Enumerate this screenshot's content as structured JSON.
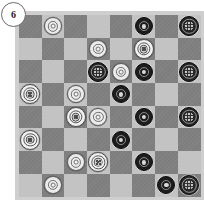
{
  "badge": {
    "label": "6",
    "name": "move-number-badge"
  },
  "board": {
    "rows": 8,
    "cols": 8,
    "colors": {
      "dark_square": "#7e7e7e",
      "light_square": "#c3c3c3",
      "frame": "#cfcfcf",
      "white_piece": "#ebebeb",
      "black_piece": "#1d1d1d",
      "page_background": "#ffffff"
    },
    "squares": [
      [
        {
          "shade": "dark",
          "piece": null
        },
        {
          "shade": "light",
          "piece": {
            "color": "white",
            "rank": "man"
          }
        },
        {
          "shade": "dark",
          "piece": null
        },
        {
          "shade": "light",
          "piece": null
        },
        {
          "shade": "dark",
          "piece": null
        },
        {
          "shade": "light",
          "piece": {
            "color": "black",
            "rank": "man"
          }
        },
        {
          "shade": "dark",
          "piece": null
        },
        {
          "shade": "light",
          "piece": {
            "color": "black",
            "rank": "king"
          }
        }
      ],
      [
        {
          "shade": "light",
          "piece": null
        },
        {
          "shade": "dark",
          "piece": null
        },
        {
          "shade": "light",
          "piece": null
        },
        {
          "shade": "dark",
          "piece": {
            "color": "white",
            "rank": "man"
          }
        },
        {
          "shade": "light",
          "piece": null
        },
        {
          "shade": "dark",
          "piece": {
            "color": "white",
            "rank": "king"
          }
        },
        {
          "shade": "light",
          "piece": null
        },
        {
          "shade": "dark",
          "piece": null
        }
      ],
      [
        {
          "shade": "dark",
          "piece": null
        },
        {
          "shade": "light",
          "piece": null
        },
        {
          "shade": "dark",
          "piece": null
        },
        {
          "shade": "light",
          "piece": {
            "color": "black",
            "rank": "king"
          }
        },
        {
          "shade": "dark",
          "piece": {
            "color": "white",
            "rank": "man"
          }
        },
        {
          "shade": "light",
          "piece": {
            "color": "black",
            "rank": "man"
          }
        },
        {
          "shade": "dark",
          "piece": null
        },
        {
          "shade": "light",
          "piece": {
            "color": "black",
            "rank": "king"
          }
        }
      ],
      [
        {
          "shade": "light",
          "piece": {
            "color": "white",
            "rank": "king"
          }
        },
        {
          "shade": "dark",
          "piece": null
        },
        {
          "shade": "light",
          "piece": {
            "color": "white",
            "rank": "man"
          }
        },
        {
          "shade": "dark",
          "piece": null
        },
        {
          "shade": "light",
          "piece": {
            "color": "black",
            "rank": "man"
          }
        },
        {
          "shade": "dark",
          "piece": null
        },
        {
          "shade": "light",
          "piece": null
        },
        {
          "shade": "dark",
          "piece": null
        }
      ],
      [
        {
          "shade": "dark",
          "piece": null
        },
        {
          "shade": "light",
          "piece": null
        },
        {
          "shade": "dark",
          "piece": {
            "color": "white",
            "rank": "king"
          }
        },
        {
          "shade": "light",
          "piece": {
            "color": "white",
            "rank": "man"
          }
        },
        {
          "shade": "dark",
          "piece": null
        },
        {
          "shade": "light",
          "piece": {
            "color": "black",
            "rank": "man"
          }
        },
        {
          "shade": "dark",
          "piece": null
        },
        {
          "shade": "light",
          "piece": {
            "color": "black",
            "rank": "king"
          }
        }
      ],
      [
        {
          "shade": "light",
          "piece": {
            "color": "white",
            "rank": "king"
          }
        },
        {
          "shade": "dark",
          "piece": null
        },
        {
          "shade": "light",
          "piece": null
        },
        {
          "shade": "dark",
          "piece": null
        },
        {
          "shade": "light",
          "piece": {
            "color": "black",
            "rank": "man"
          }
        },
        {
          "shade": "dark",
          "piece": null
        },
        {
          "shade": "light",
          "piece": null
        },
        {
          "shade": "dark",
          "piece": null
        }
      ],
      [
        {
          "shade": "dark",
          "piece": null
        },
        {
          "shade": "light",
          "piece": null
        },
        {
          "shade": "dark",
          "piece": {
            "color": "white",
            "rank": "man"
          }
        },
        {
          "shade": "light",
          "piece": {
            "color": "white",
            "rank": "king"
          }
        },
        {
          "shade": "dark",
          "piece": null
        },
        {
          "shade": "light",
          "piece": {
            "color": "black",
            "rank": "man"
          }
        },
        {
          "shade": "dark",
          "piece": null
        },
        {
          "shade": "light",
          "piece": null
        }
      ],
      [
        {
          "shade": "light",
          "piece": null
        },
        {
          "shade": "dark",
          "piece": {
            "color": "white",
            "rank": "man"
          }
        },
        {
          "shade": "light",
          "piece": null
        },
        {
          "shade": "dark",
          "piece": null
        },
        {
          "shade": "light",
          "piece": null
        },
        {
          "shade": "dark",
          "piece": null
        },
        {
          "shade": "light",
          "piece": {
            "color": "black",
            "rank": "man"
          }
        },
        {
          "shade": "dark",
          "piece": {
            "color": "black",
            "rank": "king"
          }
        }
      ]
    ]
  }
}
